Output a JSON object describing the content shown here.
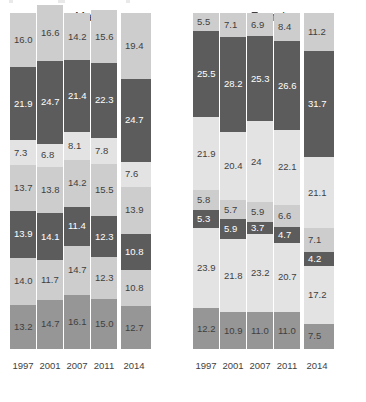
{
  "chart_data": {
    "type": "bar",
    "title": "",
    "subtitle": "",
    "xlabel": "",
    "ylabel": "",
    "grid": false,
    "legend_position": "none",
    "stacked": true,
    "orientation": "vertical",
    "ylim": [
      0,
      100
    ],
    "panels": [
      {
        "name": "Males",
        "title": "Males",
        "categories": [
          "1997",
          "2001",
          "2007",
          "2011",
          "2014"
        ],
        "bars": [
          {
            "category": "1997",
            "total": 83.0,
            "segments": [
              {
                "value": 16.0,
                "label": "16.0",
                "tone": "light"
              },
              {
                "value": 21.9,
                "label": "21.9",
                "tone": "dark"
              },
              {
                "value": 7.3,
                "label": "7.3",
                "tone": "pale"
              },
              {
                "value": 13.7,
                "label": "13.7",
                "tone": "light"
              },
              {
                "value": 13.9,
                "label": "13.9",
                "tone": "dark"
              },
              {
                "value": 14.0,
                "label": "14.0",
                "tone": "light"
              },
              {
                "value": 13.2,
                "label": "13.2",
                "tone": "mid"
              }
            ]
          },
          {
            "category": "2001",
            "total": 87.8,
            "segments": [
              {
                "value": 16.6,
                "label": "16.6",
                "tone": "light"
              },
              {
                "value": 24.7,
                "label": "24.7",
                "tone": "dark"
              },
              {
                "value": 6.8,
                "label": "6.8",
                "tone": "pale"
              },
              {
                "value": 13.8,
                "label": "13.8",
                "tone": "light"
              },
              {
                "value": 14.1,
                "label": "14.1",
                "tone": "dark"
              },
              {
                "value": 11.7,
                "label": "11.7",
                "tone": "light"
              },
              {
                "value": 14.7,
                "label": "14.7",
                "tone": "mid"
              }
            ]
          },
          {
            "category": "2007",
            "total": 90.1,
            "segments": [
              {
                "value": 14.2,
                "label": "14.2",
                "tone": "light"
              },
              {
                "value": 21.4,
                "label": "21.4",
                "tone": "dark"
              },
              {
                "value": 8.1,
                "label": "8.1",
                "tone": "pale"
              },
              {
                "value": 14.2,
                "label": "14.2",
                "tone": "light"
              },
              {
                "value": 11.4,
                "label": "11.4",
                "tone": "dark"
              },
              {
                "value": 14.7,
                "label": "14.7",
                "tone": "light"
              },
              {
                "value": 16.1,
                "label": "16.1",
                "tone": "mid"
              }
            ]
          },
          {
            "category": "2011",
            "total": 86.8,
            "segments": [
              {
                "value": 15.6,
                "label": "15.6",
                "tone": "light"
              },
              {
                "value": 22.3,
                "label": "22.3",
                "tone": "dark"
              },
              {
                "value": 7.8,
                "label": "7.8",
                "tone": "pale"
              },
              {
                "value": 15.5,
                "label": "15.5",
                "tone": "light"
              },
              {
                "value": 12.3,
                "label": "12.3",
                "tone": "dark"
              },
              {
                "value": 12.3,
                "label": "12.3",
                "tone": "light"
              },
              {
                "value": 15.0,
                "label": "15.0",
                "tone": "mid"
              }
            ]
          },
          {
            "category": "2014",
            "total": 79.1,
            "segments": [
              {
                "value": 19.4,
                "label": "19.4",
                "tone": "light"
              },
              {
                "value": 24.7,
                "label": "24.7",
                "tone": "dark"
              },
              {
                "value": 7.6,
                "label": "7.6",
                "tone": "pale"
              },
              {
                "value": 13.9,
                "label": "13.9",
                "tone": "light"
              },
              {
                "value": 10.8,
                "label": "10.8",
                "tone": "dark"
              },
              {
                "value": 10.8,
                "label": "10.8",
                "tone": "light"
              },
              {
                "value": 12.7,
                "label": "12.7",
                "tone": "mid"
              }
            ]
          }
        ]
      },
      {
        "name": "Females",
        "title": "Females",
        "categories": [
          "1997",
          "2001",
          "2007",
          "2011",
          "2014"
        ],
        "bars": [
          {
            "category": "1997",
            "total": 88.1,
            "segments": [
              {
                "value": 5.5,
                "label": "5.5",
                "tone": "light"
              },
              {
                "value": 25.5,
                "label": "25.5",
                "tone": "dark"
              },
              {
                "value": 21.9,
                "label": "21.9",
                "tone": "pale"
              },
              {
                "value": 5.8,
                "label": "5.8",
                "tone": "light"
              },
              {
                "value": 5.3,
                "label": "5.3",
                "tone": "dark"
              },
              {
                "value": 23.9,
                "label": "23.9",
                "tone": "pale"
              },
              {
                "value": 12.2,
                "label": "12.2",
                "tone": "mid"
              }
            ]
          },
          {
            "category": "2001",
            "total": 95.0,
            "segments": [
              {
                "value": 7.1,
                "label": "7.1",
                "tone": "light"
              },
              {
                "value": 28.2,
                "label": "28.2",
                "tone": "dark"
              },
              {
                "value": 20.4,
                "label": "20.4",
                "tone": "pale"
              },
              {
                "value": 5.7,
                "label": "5.7",
                "tone": "light"
              },
              {
                "value": 5.9,
                "label": "5.9",
                "tone": "dark"
              },
              {
                "value": 21.8,
                "label": "21.8",
                "tone": "pale"
              },
              {
                "value": 10.9,
                "label": "10.9",
                "tone": "mid"
              }
            ]
          },
          {
            "category": "2007",
            "total": 95.0,
            "segments": [
              {
                "value": 6.9,
                "label": "6.9",
                "tone": "light"
              },
              {
                "value": 25.3,
                "label": "25.3",
                "tone": "dark"
              },
              {
                "value": 24.0,
                "label": "24",
                "tone": "pale"
              },
              {
                "value": 5.9,
                "label": "5.9",
                "tone": "light"
              },
              {
                "value": 3.7,
                "label": "3.7",
                "tone": "dark"
              },
              {
                "value": 23.2,
                "label": "23.2",
                "tone": "pale"
              },
              {
                "value": 11.0,
                "label": "11.0",
                "tone": "mid"
              }
            ]
          },
          {
            "category": "2011",
            "total": 94.5,
            "segments": [
              {
                "value": 8.4,
                "label": "8.4",
                "tone": "light"
              },
              {
                "value": 26.6,
                "label": "26.6",
                "tone": "dark"
              },
              {
                "value": 22.1,
                "label": "22.1",
                "tone": "pale"
              },
              {
                "value": 6.6,
                "label": "6.6",
                "tone": "light"
              },
              {
                "value": 4.7,
                "label": "4.7",
                "tone": "dark"
              },
              {
                "value": 20.7,
                "label": "20.7",
                "tone": "pale"
              },
              {
                "value": 11.0,
                "label": "11.0",
                "tone": "mid"
              }
            ]
          },
          {
            "category": "2014",
            "total": 90.0,
            "segments": [
              {
                "value": 11.2,
                "label": "11.2",
                "tone": "light"
              },
              {
                "value": 31.7,
                "label": "31.7",
                "tone": "dark"
              },
              {
                "value": 21.1,
                "label": "21.1",
                "tone": "pale"
              },
              {
                "value": 7.1,
                "label": "7.1",
                "tone": "light"
              },
              {
                "value": 4.2,
                "label": "4.2",
                "tone": "dark"
              },
              {
                "value": 17.2,
                "label": "17.2",
                "tone": "pale"
              },
              {
                "value": 7.5,
                "label": "7.5",
                "tone": "mid"
              }
            ]
          }
        ]
      }
    ],
    "colors": {
      "pale": "#e3e3e3",
      "light": "#cdcdcd",
      "mid": "#969696",
      "dark": "#5c5c5c",
      "text_dark": "#3f3f3f",
      "text_light": "#ffffff",
      "background": "#ffffff"
    }
  }
}
